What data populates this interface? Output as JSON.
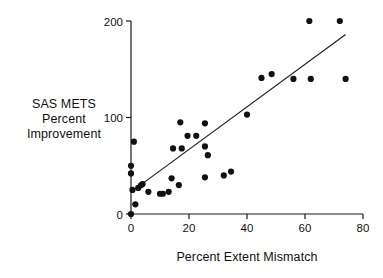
{
  "figure": {
    "background_color": "#ffffff",
    "ink_color": "#1a1a1a"
  },
  "axis_labels": {
    "y_line1": "SAS METS",
    "y_line2": "Percent",
    "y_line3": "Improvement",
    "x_title": "Percent Extent Mismatch"
  },
  "ticks": {
    "y": [
      "0",
      "100",
      "200"
    ],
    "x": [
      "0",
      "20",
      "40",
      "60",
      "80"
    ]
  },
  "chart_data": {
    "type": "scatter",
    "title": "",
    "xlabel": "Percent Extent Mismatch",
    "ylabel": "SAS METS Percent Improvement",
    "xlim": [
      0,
      80
    ],
    "ylim": [
      0,
      200
    ],
    "xticks": [
      0,
      20,
      40,
      60,
      80
    ],
    "yticks": [
      0,
      100,
      200
    ],
    "grid": false,
    "legend": "none",
    "marker": "filled-circle",
    "marker_color": "#111111",
    "marker_size_px": 5,
    "points": [
      {
        "x": 0,
        "y": 0
      },
      {
        "x": 0,
        "y": 42
      },
      {
        "x": 0,
        "y": 50
      },
      {
        "x": 0.5,
        "y": 25
      },
      {
        "x": 1,
        "y": 75
      },
      {
        "x": 1.5,
        "y": 10
      },
      {
        "x": 2.5,
        "y": 27
      },
      {
        "x": 3.5,
        "y": 30
      },
      {
        "x": 4,
        "y": 31
      },
      {
        "x": 6,
        "y": 23
      },
      {
        "x": 10,
        "y": 21
      },
      {
        "x": 11,
        "y": 21
      },
      {
        "x": 13,
        "y": 23
      },
      {
        "x": 14,
        "y": 37
      },
      {
        "x": 14.5,
        "y": 68
      },
      {
        "x": 16.5,
        "y": 30
      },
      {
        "x": 17,
        "y": 95
      },
      {
        "x": 17.5,
        "y": 68
      },
      {
        "x": 19.5,
        "y": 81
      },
      {
        "x": 22.5,
        "y": 81
      },
      {
        "x": 25.5,
        "y": 94
      },
      {
        "x": 25.5,
        "y": 70
      },
      {
        "x": 25.5,
        "y": 38
      },
      {
        "x": 26.5,
        "y": 61
      },
      {
        "x": 32,
        "y": 40
      },
      {
        "x": 34.5,
        "y": 44
      },
      {
        "x": 40,
        "y": 103
      },
      {
        "x": 45,
        "y": 141
      },
      {
        "x": 48.5,
        "y": 145
      },
      {
        "x": 56,
        "y": 140
      },
      {
        "x": 62,
        "y": 140
      },
      {
        "x": 61.5,
        "y": 200
      },
      {
        "x": 72,
        "y": 200
      },
      {
        "x": 74,
        "y": 140
      }
    ],
    "fit_line": {
      "kind": "linear-regression",
      "x_start": 1,
      "y_start": 25,
      "x_end": 74,
      "y_end": 186
    }
  }
}
